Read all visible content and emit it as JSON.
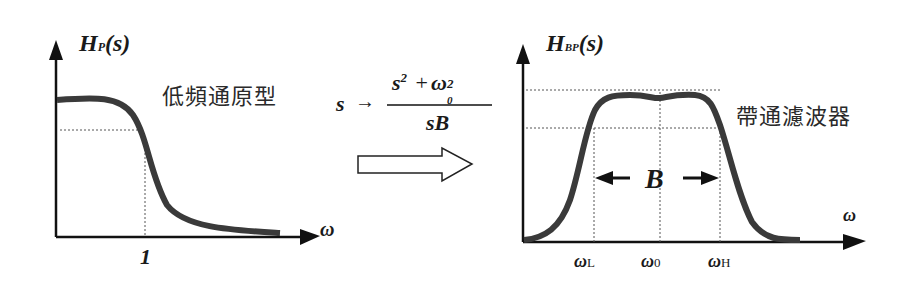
{
  "left_panel": {
    "y_label_main": "H",
    "y_label_sub": "P",
    "y_label_arg": "(s)",
    "caption": "低頻通原型",
    "x_axis_label": "ω",
    "x_tick_label": "1"
  },
  "transform": {
    "lhs": "s",
    "arrow": "→",
    "numerator_s": "s",
    "numerator_s_exp": "2",
    "plus": "+",
    "numerator_w": "ω",
    "numerator_w_exp": "2",
    "numerator_w_sub": "0",
    "denominator": "sB"
  },
  "right_panel": {
    "y_label_main": "H",
    "y_label_sub": "BP",
    "y_label_arg": "(s)",
    "caption": "帶通濾波器",
    "x_axis_label": "ω",
    "bandwidth_label": "B",
    "x_ticks": [
      {
        "main": "ω",
        "sub": "L"
      },
      {
        "main": "ω",
        "sub": "0"
      },
      {
        "main": "ω",
        "sub": "H"
      }
    ]
  },
  "colors": {
    "curve": "#3a3a3a",
    "axis": "#111111",
    "grid": "#555555"
  }
}
